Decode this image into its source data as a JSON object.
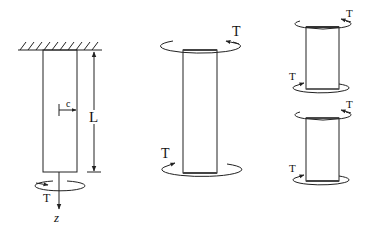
{
  "figure": {
    "panels": [
      {
        "id": "fixed-shaft",
        "labels": {
          "length": "L",
          "radius": "c",
          "torque": "T",
          "axis": "z"
        }
      },
      {
        "id": "free-body-shaft",
        "labels": {
          "torque_top": "T",
          "torque_bottom": "T"
        }
      },
      {
        "id": "segment-upper",
        "labels": {
          "torque_top": "T",
          "torque_bottom": "T"
        }
      },
      {
        "id": "segment-lower",
        "labels": {
          "torque_top": "T",
          "torque_bottom": "T"
        }
      }
    ]
  },
  "colors": {
    "line": "#222222",
    "background": "#ffffff"
  }
}
